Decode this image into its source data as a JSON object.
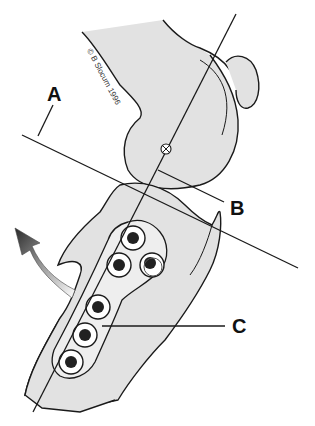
{
  "diagram": {
    "labels": {
      "a": "A",
      "b": "B",
      "c": "C"
    },
    "copyright": "© B Slocum 1996",
    "colors": {
      "bone_fill": "#e2e2e2",
      "outline": "#1a1a1a",
      "screw_head": "#222222",
      "background": "#ffffff"
    },
    "screws": {
      "count": 6
    }
  }
}
